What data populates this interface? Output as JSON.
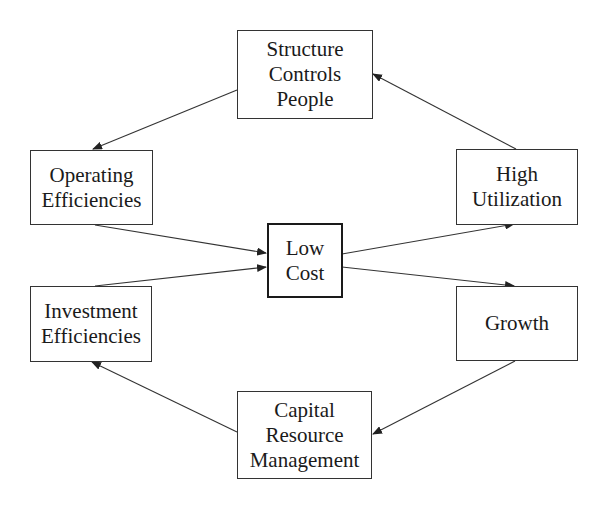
{
  "diagram": {
    "nodes": {
      "structure": {
        "label": "Structure\nControls\nPeople"
      },
      "operating": {
        "label": "Operating\nEfficiencies"
      },
      "high_util": {
        "label": "High\nUtilization"
      },
      "low_cost": {
        "label": "Low\nCost"
      },
      "investment": {
        "label": "Investment\nEfficiencies"
      },
      "growth": {
        "label": "Growth"
      },
      "capital": {
        "label": "Capital\nResource\nManagement"
      }
    },
    "edges": [
      {
        "from": "structure",
        "to": "operating"
      },
      {
        "from": "operating",
        "to": "low_cost"
      },
      {
        "from": "investment",
        "to": "low_cost"
      },
      {
        "from": "low_cost",
        "to": "high_util"
      },
      {
        "from": "low_cost",
        "to": "growth"
      },
      {
        "from": "high_util",
        "to": "structure"
      },
      {
        "from": "growth",
        "to": "capital"
      },
      {
        "from": "capital",
        "to": "investment"
      }
    ],
    "colors": {
      "line": "#333333",
      "background": "#ffffff"
    }
  }
}
